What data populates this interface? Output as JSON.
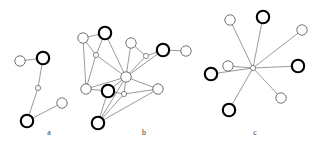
{
  "figure": {
    "width": 320,
    "height": 149,
    "background": "#ffffff",
    "edge_color": "#555555",
    "node_fill": "#ffffff",
    "node_bold_stroke": "#000000",
    "node_thin_stroke": "#5a5a5a"
  },
  "panels": [
    {
      "id": "a",
      "label": "a",
      "label_x": 49,
      "label_y": 133,
      "node_count": 5,
      "edge_count": 4
    },
    {
      "id": "b",
      "label": "b",
      "label_x": 144,
      "label_y": 133,
      "node_count": 13,
      "edge_count": 24
    },
    {
      "id": "c",
      "label": "c",
      "label_x": 255,
      "label_y": 133,
      "node_count": 9,
      "edge_count": 8
    }
  ],
  "chart_data": {
    "type": "diagram",
    "title": "",
    "subtitle": "",
    "node_styles": {
      "bold": {
        "stroke": "#000000",
        "stroke_width": 2.1,
        "radius": 6.2
      },
      "thin": {
        "stroke": "#5a5a5a",
        "stroke_width": 0.85,
        "radius": 5.2
      },
      "tiny": {
        "stroke": "#5a5a5a",
        "stroke_width": 0.7,
        "radius": 2.6
      }
    },
    "graphs": [
      {
        "id": "a",
        "label": "a",
        "nodes": [
          {
            "id": "a0",
            "x": 20,
            "y": 61,
            "style": "thin"
          },
          {
            "id": "a1",
            "x": 43,
            "y": 58,
            "style": "bold"
          },
          {
            "id": "a2",
            "x": 38,
            "y": 88,
            "style": "tiny"
          },
          {
            "id": "a3",
            "x": 62,
            "y": 103,
            "style": "thin"
          },
          {
            "id": "a4",
            "x": 27,
            "y": 121,
            "style": "bold"
          }
        ],
        "edges": [
          [
            "a0",
            "a1"
          ],
          [
            "a1",
            "a2"
          ],
          [
            "a2",
            "a4"
          ],
          [
            "a4",
            "a3"
          ]
        ]
      },
      {
        "id": "b",
        "label": "b",
        "nodes": [
          {
            "id": "b0",
            "x": 83,
            "y": 38,
            "style": "thin"
          },
          {
            "id": "b1",
            "x": 105,
            "y": 33,
            "style": "bold"
          },
          {
            "id": "b2",
            "x": 96,
            "y": 55,
            "style": "tiny"
          },
          {
            "id": "b3",
            "x": 86,
            "y": 89,
            "style": "thin"
          },
          {
            "id": "b4",
            "x": 108,
            "y": 91,
            "style": "bold"
          },
          {
            "id": "b5",
            "x": 98,
            "y": 123,
            "style": "bold"
          },
          {
            "id": "b6",
            "x": 126,
            "y": 77,
            "style": "thin"
          },
          {
            "id": "b7",
            "x": 124,
            "y": 94,
            "style": "tiny"
          },
          {
            "id": "b8",
            "x": 131,
            "y": 43,
            "style": "thin"
          },
          {
            "id": "b9",
            "x": 146,
            "y": 56,
            "style": "tiny"
          },
          {
            "id": "b10",
            "x": 163,
            "y": 50,
            "style": "bold"
          },
          {
            "id": "b11",
            "x": 186,
            "y": 51,
            "style": "thin"
          },
          {
            "id": "b12",
            "x": 158,
            "y": 89,
            "style": "thin"
          }
        ],
        "edges": [
          [
            "b0",
            "b1"
          ],
          [
            "b0",
            "b3"
          ],
          [
            "b0",
            "b2"
          ],
          [
            "b1",
            "b2"
          ],
          [
            "b1",
            "b6"
          ],
          [
            "b2",
            "b3"
          ],
          [
            "b2",
            "b6"
          ],
          [
            "b3",
            "b4"
          ],
          [
            "b3",
            "b6"
          ],
          [
            "b4",
            "b5"
          ],
          [
            "b4",
            "b6"
          ],
          [
            "b4",
            "b7"
          ],
          [
            "b5",
            "b6"
          ],
          [
            "b5",
            "b7"
          ],
          [
            "b5",
            "b12"
          ],
          [
            "b6",
            "b7"
          ],
          [
            "b6",
            "b8"
          ],
          [
            "b6",
            "b9"
          ],
          [
            "b6",
            "b10"
          ],
          [
            "b6",
            "b12"
          ],
          [
            "b7",
            "b12"
          ],
          [
            "b8",
            "b9"
          ],
          [
            "b9",
            "b10"
          ],
          [
            "b10",
            "b11"
          ]
        ]
      },
      {
        "id": "c",
        "label": "c",
        "hub": "c0",
        "nodes": [
          {
            "id": "c0",
            "x": 253,
            "y": 68,
            "style": "tiny"
          },
          {
            "id": "c1",
            "x": 230,
            "y": 20,
            "style": "thin"
          },
          {
            "id": "c2",
            "x": 263,
            "y": 17,
            "style": "bold"
          },
          {
            "id": "c3",
            "x": 302,
            "y": 30,
            "style": "thin"
          },
          {
            "id": "c4",
            "x": 298,
            "y": 66,
            "style": "bold"
          },
          {
            "id": "c5",
            "x": 281,
            "y": 98,
            "style": "thin"
          },
          {
            "id": "c6",
            "x": 229,
            "y": 110,
            "style": "bold"
          },
          {
            "id": "c7",
            "x": 211,
            "y": 74,
            "style": "bold"
          },
          {
            "id": "c8",
            "x": 228,
            "y": 66,
            "style": "thin"
          }
        ],
        "edges": [
          [
            "c0",
            "c1"
          ],
          [
            "c0",
            "c2"
          ],
          [
            "c0",
            "c3"
          ],
          [
            "c0",
            "c4"
          ],
          [
            "c0",
            "c5"
          ],
          [
            "c0",
            "c6"
          ],
          [
            "c0",
            "c7"
          ],
          [
            "c0",
            "c8"
          ]
        ]
      }
    ]
  }
}
